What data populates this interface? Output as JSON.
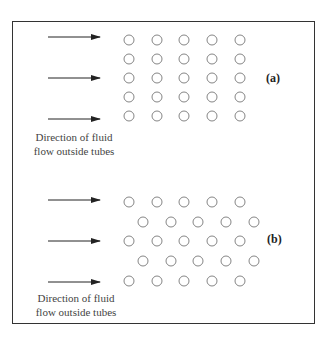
{
  "caption_fragment": "",
  "panels": [
    {
      "id": "a",
      "tag": "(a)",
      "arrangement": "in-line",
      "flow_label_line1": "Direction of fluid",
      "flow_label_line2": "flow outside tubes",
      "arrow_count": 3,
      "rows": 5,
      "tubes_per_row": 5
    },
    {
      "id": "b",
      "tag": "(b)",
      "arrangement": "staggered",
      "flow_label_line1": "Direction of fluid",
      "flow_label_line2": "flow outside tubes",
      "arrow_count": 3,
      "rows": 5,
      "tubes_per_row": 5
    }
  ],
  "colors": {
    "border": "#333333",
    "arrow": "#222222",
    "tube_stroke": "#777777",
    "text": "#444444"
  }
}
